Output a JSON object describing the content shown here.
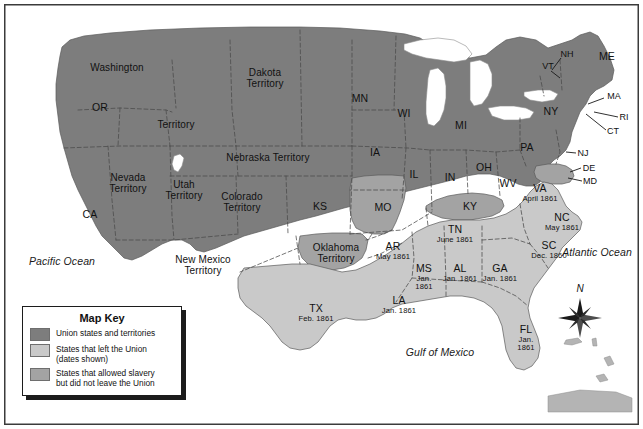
{
  "map": {
    "title": "United States 1861 Secession Map",
    "oceans": [
      {
        "name": "Pacific Ocean",
        "label": "Pacific Ocean"
      },
      {
        "name": "Atlantic Ocean",
        "label": "Atlantic Ocean"
      },
      {
        "name": "Gulf of Mexico",
        "label": "Gulf of Mexico"
      }
    ],
    "compass": {
      "north_label": "N"
    },
    "colors": {
      "union": "#7d7d7d",
      "seceded": "#c9c9c9",
      "slave_in_union": "#a3a3a3",
      "water": "#ffffff",
      "border": "#3b3b3b",
      "boundary": "#4a4a4a",
      "text": "#111111"
    },
    "legend": {
      "title": "Map Key",
      "items": [
        {
          "swatch": "union",
          "label": "Union states and territories"
        },
        {
          "swatch": "seceded",
          "label": "States that left the Union\n(dates shown)"
        },
        {
          "swatch": "slave_in_union",
          "label": "States that allowed slavery\nbut did not leave the Union"
        }
      ]
    },
    "labels": [
      {
        "name": "washington-territory-label",
        "text": "Washington",
        "date": "",
        "x": 117,
        "y": 68,
        "class": "terr"
      },
      {
        "name": "washington-territory-label2",
        "text": "Territory",
        "date": "",
        "x": 176,
        "y": 125,
        "class": "terr"
      },
      {
        "name": "oregon-label",
        "text": "OR",
        "date": "",
        "x": 100,
        "y": 108,
        "class": "big"
      },
      {
        "name": "nevada-territory-label",
        "text": "Nevada\nTerritory",
        "date": "",
        "x": 128,
        "y": 183,
        "class": "terr"
      },
      {
        "name": "california-label",
        "text": "CA",
        "date": "",
        "x": 90,
        "y": 215,
        "class": "big"
      },
      {
        "name": "utah-territory-label",
        "text": "Utah\nTerritory",
        "date": "",
        "x": 184,
        "y": 190,
        "class": "terr"
      },
      {
        "name": "colorado-territory-label",
        "text": "Colorado\nTerritory",
        "date": "",
        "x": 242,
        "y": 202,
        "class": "terr"
      },
      {
        "name": "dakota-territory-label",
        "text": "Dakota\nTerritory",
        "date": "",
        "x": 265,
        "y": 78,
        "class": "terr"
      },
      {
        "name": "nebraska-territory-label",
        "text": "Nebraska Territory",
        "date": "",
        "x": 268,
        "y": 158,
        "class": "terr"
      },
      {
        "name": "kansas-label",
        "text": "KS",
        "date": "",
        "x": 320,
        "y": 207,
        "class": "big"
      },
      {
        "name": "minnesota-label",
        "text": "MN",
        "date": "",
        "x": 360,
        "y": 99,
        "class": "big"
      },
      {
        "name": "wisconsin-label",
        "text": "WI",
        "date": "",
        "x": 404,
        "y": 114,
        "class": "big"
      },
      {
        "name": "iowa-label",
        "text": "IA",
        "date": "",
        "x": 375,
        "y": 153,
        "class": "big"
      },
      {
        "name": "missouri-label",
        "text": "MO",
        "date": "",
        "x": 383,
        "y": 208,
        "class": "big"
      },
      {
        "name": "illinois-label",
        "text": "IL",
        "date": "",
        "x": 414,
        "y": 175,
        "class": "big"
      },
      {
        "name": "indiana-label",
        "text": "IN",
        "date": "",
        "x": 450,
        "y": 178,
        "class": "big"
      },
      {
        "name": "michigan-label",
        "text": "MI",
        "date": "",
        "x": 461,
        "y": 126,
        "class": "big"
      },
      {
        "name": "ohio-label",
        "text": "OH",
        "date": "",
        "x": 484,
        "y": 168,
        "class": "big"
      },
      {
        "name": "kentucky-label",
        "text": "KY",
        "date": "",
        "x": 470,
        "y": 207,
        "class": "big"
      },
      {
        "name": "west-virginia-label",
        "text": "WV",
        "date": "",
        "x": 508,
        "y": 184,
        "class": "big"
      },
      {
        "name": "pennsylvania-label",
        "text": "PA",
        "date": "",
        "x": 527,
        "y": 148,
        "class": "big"
      },
      {
        "name": "new-york-label",
        "text": "NY",
        "date": "",
        "x": 551,
        "y": 112,
        "class": "big"
      },
      {
        "name": "maine-label",
        "text": "ME",
        "date": "",
        "x": 607,
        "y": 57,
        "class": "big"
      },
      {
        "name": "new-hampshire-label",
        "text": "NH",
        "date": "",
        "x": 567,
        "y": 54,
        "class": "tiny"
      },
      {
        "name": "vermont-label",
        "text": "VT",
        "date": "",
        "x": 548,
        "y": 66,
        "class": "tiny"
      },
      {
        "name": "massachusetts-label",
        "text": "MA",
        "date": "",
        "x": 614,
        "y": 96,
        "class": "tiny"
      },
      {
        "name": "rhode-island-label",
        "text": "RI",
        "date": "",
        "x": 624,
        "y": 117,
        "class": "tiny"
      },
      {
        "name": "connecticut-label",
        "text": "CT",
        "date": "",
        "x": 613,
        "y": 131,
        "class": "tiny"
      },
      {
        "name": "new-jersey-label",
        "text": "NJ",
        "date": "",
        "x": 583,
        "y": 153,
        "class": "tiny"
      },
      {
        "name": "delaware-label",
        "text": "DE",
        "date": "",
        "x": 589,
        "y": 168,
        "class": "tiny"
      },
      {
        "name": "maryland-label",
        "text": "MD",
        "date": "",
        "x": 590,
        "y": 181,
        "class": "tiny"
      },
      {
        "name": "virginia-label",
        "text": "VA",
        "date": "April 1861",
        "x": 540,
        "y": 193,
        "class": "big"
      },
      {
        "name": "north-carolina-label",
        "text": "NC",
        "date": "May 1861",
        "x": 562,
        "y": 222,
        "class": "big"
      },
      {
        "name": "south-carolina-label",
        "text": "SC",
        "date": "Dec. 1860",
        "x": 549,
        "y": 250,
        "class": "big"
      },
      {
        "name": "tennessee-label",
        "text": "TN",
        "date": "June 1861",
        "x": 455,
        "y": 234,
        "class": "big"
      },
      {
        "name": "georgia-label",
        "text": "GA",
        "date": "Jan. 1861",
        "x": 500,
        "y": 273,
        "class": "big"
      },
      {
        "name": "alabama-label",
        "text": "AL",
        "date": "Jan. 1861",
        "x": 460,
        "y": 273,
        "class": "big"
      },
      {
        "name": "mississippi-label",
        "text": "MS",
        "date": "Jan.\n1861",
        "x": 424,
        "y": 277,
        "class": "big"
      },
      {
        "name": "louisiana-label",
        "text": "LA",
        "date": "Jan. 1861",
        "x": 399,
        "y": 305,
        "class": "big"
      },
      {
        "name": "arkansas-label",
        "text": "AR",
        "date": "May 1861",
        "x": 393,
        "y": 251,
        "class": "big"
      },
      {
        "name": "florida-label",
        "text": "FL",
        "date": "Jan.\n1861",
        "x": 526,
        "y": 338,
        "class": "big"
      },
      {
        "name": "texas-label",
        "text": "TX",
        "date": "Feb. 1861",
        "x": 316,
        "y": 313,
        "class": "big"
      },
      {
        "name": "oklahoma-territory-label",
        "text": "Oklahoma\nTerritory",
        "date": "",
        "x": 336,
        "y": 253,
        "class": "terr"
      },
      {
        "name": "new-mexico-territory-label",
        "text": "New Mexico\nTerritory",
        "date": "",
        "x": 203,
        "y": 265,
        "class": "terr"
      }
    ]
  }
}
